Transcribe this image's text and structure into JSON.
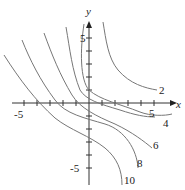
{
  "figure": {
    "type": "contour-plot",
    "x_axis_label": "x",
    "y_axis_label": "y",
    "x_tick_label": "-5",
    "y_tick_label_pos": "5",
    "y_tick_label_neg": "-5",
    "level_labels": [
      "2",
      "4",
      "5",
      "6",
      "8",
      "10"
    ]
  }
}
